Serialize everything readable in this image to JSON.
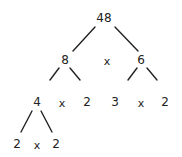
{
  "diagram": {
    "type": "factor-tree",
    "root": "48",
    "nodes": [
      {
        "id": "n48",
        "label": "48",
        "x": 104,
        "y": 18
      },
      {
        "id": "n8",
        "label": "8",
        "x": 65,
        "y": 60
      },
      {
        "id": "op1",
        "label": "x",
        "x": 107,
        "y": 61
      },
      {
        "id": "n6",
        "label": "6",
        "x": 141,
        "y": 60
      },
      {
        "id": "n4",
        "label": "4",
        "x": 37,
        "y": 102
      },
      {
        "id": "op2",
        "label": "x",
        "x": 62,
        "y": 103
      },
      {
        "id": "n2a",
        "label": "2",
        "x": 87,
        "y": 102
      },
      {
        "id": "n3",
        "label": "3",
        "x": 115,
        "y": 102
      },
      {
        "id": "op3",
        "label": "x",
        "x": 141,
        "y": 103
      },
      {
        "id": "n2b",
        "label": "2",
        "x": 165,
        "y": 102
      },
      {
        "id": "n2c",
        "label": "2",
        "x": 17,
        "y": 144
      },
      {
        "id": "op4",
        "label": "x",
        "x": 37,
        "y": 145
      },
      {
        "id": "n2d",
        "label": "2",
        "x": 56,
        "y": 144
      }
    ],
    "edges": [
      {
        "from": "48",
        "to": "8",
        "x1": 95,
        "y1": 27,
        "x2": 73,
        "y2": 51
      },
      {
        "from": "48",
        "to": "6",
        "x1": 115,
        "y1": 27,
        "x2": 138,
        "y2": 51
      },
      {
        "from": "8",
        "to": "4",
        "x1": 59,
        "y1": 68,
        "x2": 50,
        "y2": 80
      },
      {
        "from": "8",
        "to": "2",
        "x1": 70,
        "y1": 68,
        "x2": 80,
        "y2": 80
      },
      {
        "from": "6",
        "to": "3",
        "x1": 137,
        "y1": 68,
        "x2": 128,
        "y2": 80
      },
      {
        "from": "6",
        "to": "2",
        "x1": 147,
        "y1": 68,
        "x2": 157,
        "y2": 80
      },
      {
        "from": "4",
        "to": "2",
        "x1": 32,
        "y1": 111,
        "x2": 21,
        "y2": 132
      },
      {
        "from": "4",
        "to": "2",
        "x1": 41,
        "y1": 111,
        "x2": 52,
        "y2": 132
      }
    ],
    "line_color": "#222222",
    "text_color": "#222222"
  }
}
